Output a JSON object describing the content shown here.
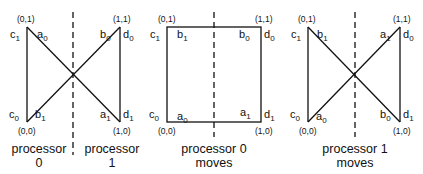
{
  "panels": [
    {
      "id": "initial",
      "caption_left": [
        "processor",
        "0"
      ],
      "caption_right": [
        "processor",
        "1"
      ],
      "shape": "bowtie",
      "corners": {
        "tl": "(0,1)",
        "tr": "(1,1)",
        "bl": "(0,0)",
        "br": "(1,0)"
      },
      "labels": {
        "left_top": {
          "v": "c",
          "s": "1"
        },
        "left_bottom": {
          "v": "c",
          "s": "0"
        },
        "right_top": {
          "v": "d",
          "s": "0"
        },
        "right_bottom": {
          "v": "d",
          "s": "1"
        },
        "inner_tl": {
          "v": "a",
          "s": "0"
        },
        "inner_bl": {
          "v": "b",
          "s": "1"
        },
        "inner_tr": {
          "v": "b",
          "s": "0"
        },
        "inner_br": {
          "v": "a",
          "s": "1"
        }
      }
    },
    {
      "id": "processor-0-moves",
      "caption": [
        "processor 0",
        "moves"
      ],
      "shape": "square",
      "corners": {
        "tl": "(0,1)",
        "tr": "(1,1)",
        "bl": "(0,0)",
        "br": "(1,0)"
      },
      "labels": {
        "left_top": {
          "v": "c",
          "s": "1"
        },
        "left_bottom": {
          "v": "c",
          "s": "0"
        },
        "right_top": {
          "v": "d",
          "s": "0"
        },
        "right_bottom": {
          "v": "d",
          "s": "1"
        },
        "inner_tl": {
          "v": "b",
          "s": "1"
        },
        "inner_bl": {
          "v": "a",
          "s": "0"
        },
        "inner_tr": {
          "v": "b",
          "s": "0"
        },
        "inner_br": {
          "v": "a",
          "s": "1"
        }
      }
    },
    {
      "id": "processor-1-moves",
      "caption": [
        "processor 1",
        "moves"
      ],
      "shape": "bowtie",
      "corners": {
        "tl": "(0,1)",
        "tr": "(1,1)",
        "bl": "(0,0)",
        "br": "(1,0)"
      },
      "labels": {
        "left_top": {
          "v": "c",
          "s": "1"
        },
        "left_bottom": {
          "v": "c",
          "s": "0"
        },
        "right_top": {
          "v": "d",
          "s": "0"
        },
        "right_bottom": {
          "v": "d",
          "s": "1"
        },
        "inner_tl": {
          "v": "b",
          "s": "1"
        },
        "inner_bl": {
          "v": "a",
          "s": "0"
        },
        "inner_tr": {
          "v": "a",
          "s": "1"
        },
        "inner_br": {
          "v": "b",
          "s": "0"
        }
      }
    }
  ]
}
